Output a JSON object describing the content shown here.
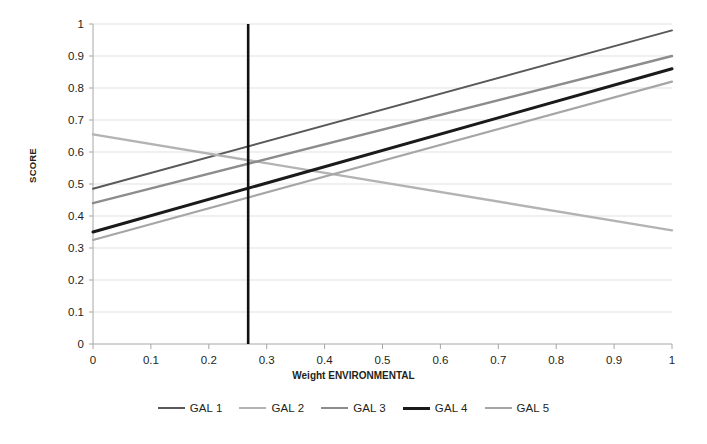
{
  "chart_data": {
    "type": "line",
    "title": "",
    "xlabel": "Weight ENVIRONMENTAL",
    "ylabel": "SCORE",
    "xlim": [
      0,
      1
    ],
    "ylim": [
      0,
      1
    ],
    "xticks": [
      "0",
      "0.1",
      "0.2",
      "0.3",
      "0.4",
      "0.5",
      "0.6",
      "0.7",
      "0.8",
      "0.9",
      "1"
    ],
    "xtick_values": [
      0,
      0.1,
      0.2,
      0.3,
      0.4,
      0.5,
      0.6,
      0.7,
      0.8,
      0.9,
      1
    ],
    "yticks": [
      "0",
      "0.1",
      "0.2",
      "0.3",
      "0.4",
      "0.5",
      "0.6",
      "0.7",
      "0.8",
      "0.9",
      "1"
    ],
    "ytick_values": [
      0,
      0.1,
      0.2,
      0.3,
      0.4,
      0.5,
      0.6,
      0.7,
      0.8,
      0.9,
      1
    ],
    "grid": "horizontal",
    "legend_position": "bottom",
    "x": [
      0,
      1
    ],
    "series": [
      {
        "name": "GAL 1",
        "values": [
          0.485,
          0.98
        ],
        "color": "#595959",
        "width": 2.0
      },
      {
        "name": "GAL 2",
        "values": [
          0.655,
          0.355
        ],
        "color": "#b3b3b3",
        "width": 2.4
      },
      {
        "name": "GAL 3",
        "values": [
          0.44,
          0.9
        ],
        "color": "#8c8c8c",
        "width": 2.4
      },
      {
        "name": "GAL 4",
        "values": [
          0.35,
          0.86
        ],
        "color": "#1a1a1a",
        "width": 3.0
      },
      {
        "name": "GAL 5",
        "values": [
          0.325,
          0.82
        ],
        "color": "#a6a6a6",
        "width": 2.2
      }
    ],
    "annotations": [
      {
        "name": "vertical-marker",
        "type": "vline",
        "x": 0.268,
        "y_from": 0,
        "y_to": 1,
        "color": "#111111",
        "width": 2.6
      }
    ],
    "axis_color": "#a6a6a6",
    "grid_color": "#d9d9d9"
  },
  "legend": {
    "items": [
      {
        "label": "GAL 1",
        "color": "#595959",
        "width": 2.0
      },
      {
        "label": "GAL 2",
        "color": "#b3b3b3",
        "width": 2.4
      },
      {
        "label": "GAL 3",
        "color": "#8c8c8c",
        "width": 2.4
      },
      {
        "label": "GAL 4",
        "color": "#1a1a1a",
        "width": 3.2
      },
      {
        "label": "GAL 5",
        "color": "#a6a6a6",
        "width": 2.2
      }
    ]
  }
}
